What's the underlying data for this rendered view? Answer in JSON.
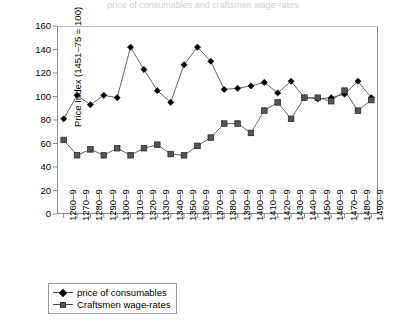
{
  "figure": {
    "clipped_title": "price of consumables and craftsmen wage-rates"
  },
  "legend": {
    "position": "below-left",
    "items": [
      {
        "label": "price of consumables",
        "marker": "diamond-marker-icon",
        "color": "#000000"
      },
      {
        "label": "Craftsmen wage-rates",
        "marker": "square-marker-icon",
        "color": "#555555"
      }
    ]
  },
  "axes": {
    "ylabel": "Price Index (1451–75 = 100)",
    "xlabel": "",
    "yticks": [
      0,
      20,
      40,
      60,
      80,
      100,
      120,
      140,
      160
    ],
    "ylim": [
      0,
      160
    ]
  },
  "chart_data": {
    "type": "line",
    "title": "",
    "xlabel": "",
    "ylabel": "Price Index (1451–75 = 100)",
    "ylim": [
      0,
      160
    ],
    "grid": false,
    "legend_position": "below-left",
    "categories": [
      "1260–9",
      "1270–9",
      "1280–9",
      "1290–9",
      "1300–9",
      "1310–9",
      "1320–9",
      "1330–9",
      "1340–9",
      "1350–9",
      "1360–9",
      "1370–9",
      "1380–9",
      "1390–9",
      "1400–9",
      "1410–9",
      "1420–9",
      "1430–9",
      "1440–9",
      "1450–9",
      "1460–9",
      "1470–9",
      "1480–9",
      "1490–9"
    ],
    "series": [
      {
        "name": "price of consumables",
        "marker": "diamond",
        "color": "#000000",
        "values": [
          81,
          101,
          93,
          101,
          99,
          142,
          123,
          105,
          95,
          127,
          142,
          130,
          106,
          107,
          109,
          112,
          103,
          113,
          99,
          98,
          99,
          102,
          113,
          99
        ]
      },
      {
        "name": "Craftsmen wage-rates",
        "marker": "square",
        "color": "#555555",
        "values": [
          63,
          50,
          55,
          50,
          56,
          50,
          56,
          59,
          51,
          50,
          58,
          65,
          77,
          77,
          69,
          88,
          95,
          81,
          99,
          99,
          96,
          105,
          88,
          97
        ]
      }
    ]
  }
}
